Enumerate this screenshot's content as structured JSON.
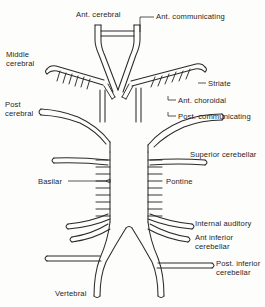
{
  "diagram": {
    "style": "line drawing, double-outline vessels, black on white",
    "colors": {
      "ink": "#2b2b2b",
      "background": "#fdfdfc",
      "label_text": "#1d1d1d"
    },
    "labels": {
      "ant_cerebral": "Ant. cerebral",
      "ant_communicating": "Ant. communicating",
      "middle_cerebral_line1": "Middle",
      "middle_cerebral_line2": "cerebral",
      "striate": "Striate",
      "ant_choroidal": "Ant. choroidal",
      "post_communicating": "Post. communicating",
      "post_cerebral_line1": "Post",
      "post_cerebral_line2": "cerebral",
      "superior_cerebellar": "Superior cerebellar",
      "basilar": "Basilar",
      "pontine": "Pontine",
      "internal_auditory": "Internal auditory",
      "ant_inferior_cerebellar_line1": "Ant inferior",
      "ant_inferior_cerebellar_line2": "cerebellar",
      "post_inferior_cerebellar_line1": "Post. inferior",
      "post_inferior_cerebellar_line2": "cerebellar",
      "vertebral": "Vertebral"
    },
    "structures": [
      {
        "name": "anterior-cerebral-artery",
        "count": 2,
        "orientation": "vertical, diverging downward"
      },
      {
        "name": "anterior-communicating-artery",
        "count": 1,
        "orientation": "horizontal bridge"
      },
      {
        "name": "middle-cerebral-artery",
        "count": 2,
        "orientation": "lateral, upward sloping"
      },
      {
        "name": "striate-branches",
        "count": 12,
        "orientation": "small hatch branches"
      },
      {
        "name": "anterior-choroidal-artery",
        "count": 2,
        "orientation": "short oblique"
      },
      {
        "name": "posterior-communicating-artery",
        "count": 2,
        "orientation": "vertical short"
      },
      {
        "name": "posterior-cerebral-artery",
        "count": 2,
        "orientation": "lateral, inverted V"
      },
      {
        "name": "superior-cerebellar-artery",
        "count": 2,
        "orientation": "lateral horizontal"
      },
      {
        "name": "basilar-artery",
        "count": 1,
        "orientation": "vertical midline trunk"
      },
      {
        "name": "pontine-branches",
        "count": 18,
        "orientation": "paired short horizontal"
      },
      {
        "name": "internal-auditory-artery",
        "count": 2,
        "orientation": "lateral downward sloping"
      },
      {
        "name": "anterior-inferior-cerebellar-artery",
        "count": 2,
        "orientation": "lateral downward sloping"
      },
      {
        "name": "posterior-inferior-cerebellar-artery",
        "count": 2,
        "orientation": "lateral horizontal"
      },
      {
        "name": "vertebral-artery",
        "count": 2,
        "orientation": "curved, converging upward"
      }
    ]
  }
}
